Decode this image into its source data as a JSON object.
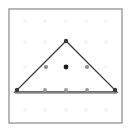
{
  "figure": {
    "kind": "geoboard-lattice-triangle",
    "canvas": {
      "width": 131,
      "height": 132,
      "background": "#ffffff"
    },
    "frame": {
      "x": 9,
      "y": 9,
      "width": 113,
      "height": 114,
      "stroke": "#9a9a9a",
      "stroke_width": 1.4,
      "fill": "#ffffff"
    },
    "lattice": {
      "rows": 5,
      "cols": 5,
      "x_positions": [
        25,
        45,
        66,
        86,
        106
      ],
      "y_positions": [
        21,
        42,
        67,
        91,
        110
      ],
      "dot_radius": 1.9,
      "faint_color": "#f3f3f3",
      "marked_color": "#9d9d9d",
      "vertex_color": "#3a3a3a",
      "centroid_color": "#1e1e1e"
    },
    "triangle": {
      "stroke": "#3c3c3c",
      "stroke_width": 1.3,
      "fill": "none",
      "vertices": [
        {
          "name": "apex",
          "x": 66,
          "y": 41,
          "label": "top"
        },
        {
          "name": "base-left",
          "x": 15,
          "y": 92,
          "label": "bottom-left"
        },
        {
          "name": "base-right",
          "x": 117,
          "y": 92,
          "label": "bottom-right"
        }
      ]
    },
    "base_line": {
      "x1": 15,
      "y1": 93,
      "x2": 117,
      "y2": 93,
      "stroke": "#8c8c8c",
      "stroke_width": 1.6
    },
    "marked_points": [
      {
        "name": "vertex-apex",
        "x": 66,
        "y": 41,
        "radius": 2.2,
        "color": "#3a3a3a"
      },
      {
        "name": "vertex-base-left",
        "x": 17,
        "y": 90,
        "radius": 2.2,
        "color": "#3a3a3a"
      },
      {
        "name": "vertex-base-right",
        "x": 115,
        "y": 90,
        "radius": 2.2,
        "color": "#3a3a3a"
      },
      {
        "name": "edge-left-midpoint",
        "x": 46,
        "y": 67,
        "radius": 2.1,
        "color": "#8e8e8e"
      },
      {
        "name": "edge-right-midpoint",
        "x": 87,
        "y": 67,
        "radius": 2.1,
        "color": "#8e8e8e"
      },
      {
        "name": "interior-centroid",
        "x": 66,
        "y": 67,
        "radius": 2.4,
        "color": "#1a1a1a"
      },
      {
        "name": "base-point-left",
        "x": 45,
        "y": 90,
        "radius": 2.0,
        "color": "#9a9a9a"
      },
      {
        "name": "base-point-center",
        "x": 66,
        "y": 90,
        "radius": 2.0,
        "color": "#9a9a9a"
      },
      {
        "name": "base-point-right",
        "x": 87,
        "y": 90,
        "radius": 2.0,
        "color": "#9a9a9a"
      }
    ],
    "faint_points": [
      {
        "x": 25,
        "y": 21
      },
      {
        "x": 45,
        "y": 21
      },
      {
        "x": 66,
        "y": 21
      },
      {
        "x": 86,
        "y": 21
      },
      {
        "x": 106,
        "y": 21
      },
      {
        "x": 25,
        "y": 42
      },
      {
        "x": 45,
        "y": 42
      },
      {
        "x": 86,
        "y": 42
      },
      {
        "x": 106,
        "y": 42
      },
      {
        "x": 25,
        "y": 67
      },
      {
        "x": 106,
        "y": 67
      },
      {
        "x": 25,
        "y": 110
      },
      {
        "x": 45,
        "y": 110
      },
      {
        "x": 66,
        "y": 110
      },
      {
        "x": 86,
        "y": 110
      },
      {
        "x": 106,
        "y": 110
      }
    ]
  }
}
